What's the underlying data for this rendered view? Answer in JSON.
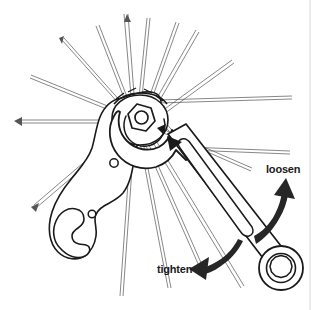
{
  "figure": {
    "kind": "technical-line-illustration",
    "background_color": "#ffffff",
    "line_color": "#1a1a1a",
    "spoke_color": "#555555",
    "arrow_color": "#262626"
  },
  "annotations": [
    {
      "id": "loosen",
      "label": "loosen",
      "direction": "up-right",
      "arrow": "curved-arrow-up-right"
    },
    {
      "id": "tighten",
      "label": "tighten",
      "direction": "down-left",
      "arrow": "curved-arrow-down-left"
    }
  ],
  "parts": {
    "hub_nut": "locknut",
    "cone_wrench": "cone-wrench",
    "combination_wrench": "combination-wrench",
    "box_end": "box-end-ring",
    "spokes": "wheel-spokes"
  }
}
